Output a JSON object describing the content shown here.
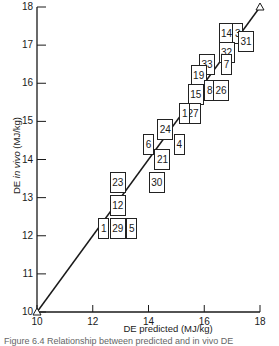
{
  "chart_data": {
    "type": "scatter",
    "title": "",
    "xlabel": "DE predicted (MJ/kg)",
    "ylabel_prefix": "DE ",
    "ylabel_italic": "in vivo",
    "ylabel_suffix": " (MJ/kg)",
    "xlim": [
      10,
      18
    ],
    "ylim": [
      10,
      18
    ],
    "x_ticks": [
      "10",
      "12",
      "14",
      "16",
      "18"
    ],
    "y_ticks": [
      "10",
      "11",
      "12",
      "13",
      "14",
      "15",
      "16",
      "17",
      "18"
    ],
    "grid": false,
    "line_of_equality": {
      "from": [
        10,
        10
      ],
      "to": [
        18,
        18
      ],
      "end_markers": "triangle"
    },
    "points": [
      {
        "label": "14",
        "x": 16.8,
        "y": 17.3
      },
      {
        "label": "3",
        "x": 17.2,
        "y": 17.3
      },
      {
        "label": "31",
        "x": 17.5,
        "y": 17.1
      },
      {
        "label": "32",
        "x": 16.8,
        "y": 16.8
      },
      {
        "label": "33",
        "x": 16.1,
        "y": 16.5
      },
      {
        "label": "7",
        "x": 16.8,
        "y": 16.5
      },
      {
        "label": "19",
        "x": 15.8,
        "y": 16.2
      },
      {
        "label": "8",
        "x": 16.2,
        "y": 15.8
      },
      {
        "label": "26",
        "x": 16.6,
        "y": 15.8
      },
      {
        "label": "15",
        "x": 15.7,
        "y": 15.7
      },
      {
        "label": "27",
        "x": 15.6,
        "y": 15.2
      },
      {
        "label": "1",
        "x": 15.3,
        "y": 15.2
      },
      {
        "label": "24",
        "x": 14.6,
        "y": 14.8
      },
      {
        "label": "4",
        "x": 15.1,
        "y": 14.4
      },
      {
        "label": "6",
        "x": 14.0,
        "y": 14.4
      },
      {
        "label": "21",
        "x": 14.5,
        "y": 14.0
      },
      {
        "label": "30",
        "x": 14.3,
        "y": 13.4
      },
      {
        "label": "23",
        "x": 12.9,
        "y": 13.4
      },
      {
        "label": "12",
        "x": 12.9,
        "y": 12.8
      },
      {
        "label": "1",
        "x": 12.4,
        "y": 12.2
      },
      {
        "label": "29",
        "x": 12.9,
        "y": 12.2
      },
      {
        "label": "5",
        "x": 13.4,
        "y": 12.2
      }
    ]
  },
  "caption": "Figure 6.4  Relationship between predicted and in vivo DE"
}
